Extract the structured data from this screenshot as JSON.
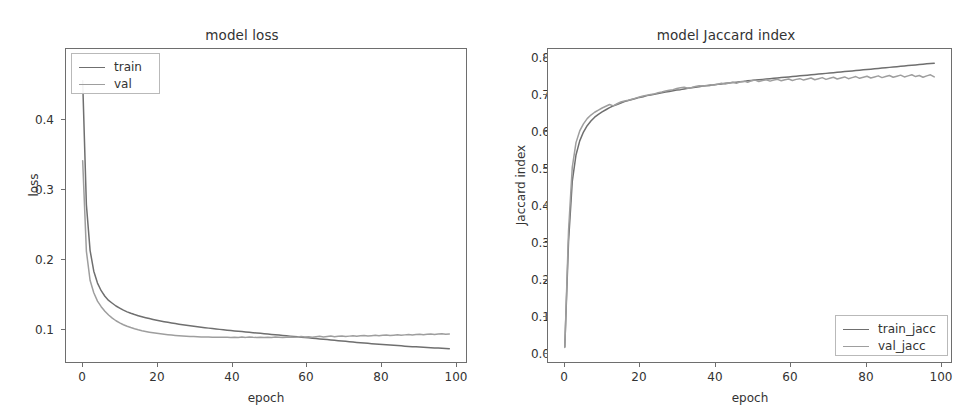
{
  "figure": {
    "background": "#ffffff",
    "width": 968,
    "height": 418
  },
  "colors": {
    "train": "#6f6f6f",
    "val": "#9e9e9e",
    "axis": "#6e6e6e",
    "text": "#333333"
  },
  "panels": {
    "loss": {
      "title": "model loss",
      "xlabel": "epoch",
      "ylabel": "loss",
      "xticks": [
        "0",
        "20",
        "40",
        "60",
        "80",
        "100"
      ],
      "yticks": [
        "0.1",
        "0.2",
        "0.3",
        "0.4"
      ],
      "legend": {
        "position": "upper left",
        "entries": [
          "train",
          "val"
        ]
      }
    },
    "jaccard": {
      "title": "model Jaccard index",
      "xlabel": "epoch",
      "ylabel": "Jaccard index",
      "xticks": [
        "0",
        "20",
        "40",
        "60",
        "80",
        "100"
      ],
      "yticks": [
        "0.0",
        "0.1",
        "0.2",
        "0.3",
        "0.4",
        "0.5",
        "0.6",
        "0.7",
        "0.8"
      ],
      "legend": {
        "position": "lower right",
        "entries": [
          "train_jacc",
          "val_jacc"
        ]
      }
    }
  },
  "chart_data": [
    {
      "type": "line",
      "title": "model loss",
      "xlabel": "epoch",
      "ylabel": "loss",
      "xlim": [
        -4.5,
        103.5
      ],
      "ylim": [
        0.0255,
        0.4755
      ],
      "xticks": [
        0,
        20,
        40,
        60,
        80,
        100
      ],
      "yticks": [
        0.1,
        0.2,
        0.3,
        0.4
      ],
      "grid": false,
      "legend_position": "upper left",
      "x": [
        0,
        1,
        2,
        3,
        4,
        5,
        6,
        7,
        8,
        9,
        10,
        11,
        12,
        13,
        14,
        15,
        16,
        17,
        18,
        19,
        20,
        21,
        22,
        23,
        24,
        25,
        26,
        27,
        28,
        29,
        30,
        31,
        32,
        33,
        34,
        35,
        36,
        37,
        38,
        39,
        40,
        41,
        42,
        43,
        44,
        45,
        46,
        47,
        48,
        49,
        50,
        51,
        52,
        53,
        54,
        55,
        56,
        57,
        58,
        59,
        60,
        61,
        62,
        63,
        64,
        65,
        66,
        67,
        68,
        69,
        70,
        71,
        72,
        73,
        74,
        75,
        76,
        77,
        78,
        79,
        80,
        81,
        82,
        83,
        84,
        85,
        86,
        87,
        88,
        89,
        90,
        91,
        92,
        93,
        94,
        95,
        96,
        97,
        98,
        99
      ],
      "series": [
        {
          "name": "train",
          "color": "#6f6f6f",
          "values": [
            0.43,
            0.252,
            0.186,
            0.156,
            0.139,
            0.128,
            0.12,
            0.114,
            0.11,
            0.106,
            0.103,
            0.1,
            0.0975,
            0.0955,
            0.0937,
            0.0921,
            0.0906,
            0.0892,
            0.0879,
            0.0867,
            0.0856,
            0.0845,
            0.0835,
            0.0825,
            0.0816,
            0.0807,
            0.0799,
            0.0791,
            0.0783,
            0.0776,
            0.0769,
            0.0762,
            0.0755,
            0.0748,
            0.0742,
            0.0736,
            0.073,
            0.0724,
            0.0718,
            0.0713,
            0.0707,
            0.0702,
            0.0697,
            0.0692,
            0.0687,
            0.0682,
            0.0677,
            0.0672,
            0.0667,
            0.0662,
            0.0657,
            0.0652,
            0.0647,
            0.0642,
            0.0637,
            0.0632,
            0.0627,
            0.0622,
            0.0617,
            0.0612,
            0.0607,
            0.0602,
            0.0597,
            0.0592,
            0.0587,
            0.0582,
            0.0577,
            0.0572,
            0.0567,
            0.0562,
            0.0557,
            0.0552,
            0.0547,
            0.0542,
            0.0537,
            0.0532,
            0.0527,
            0.0523,
            0.0519,
            0.0515,
            0.0511,
            0.0507,
            0.0503,
            0.0499,
            0.0495,
            0.0491,
            0.0487,
            0.0483,
            0.0479,
            0.0476,
            0.0473,
            0.047,
            0.0467,
            0.0464,
            0.0461,
            0.0458,
            0.0455,
            0.0452,
            0.0449,
            0.0446
          ]
        },
        {
          "name": "val",
          "color": "#9e9e9e",
          "values": [
            0.315,
            0.185,
            0.143,
            0.125,
            0.113,
            0.105,
            0.0985,
            0.093,
            0.0885,
            0.0848,
            0.0817,
            0.0791,
            0.0769,
            0.075,
            0.0733,
            0.0718,
            0.0705,
            0.0694,
            0.0684,
            0.0675,
            0.0667,
            0.066,
            0.0653,
            0.0647,
            0.0642,
            0.0637,
            0.0633,
            0.0629,
            0.0626,
            0.0623,
            0.062,
            0.0618,
            0.0616,
            0.0614,
            0.0613,
            0.0612,
            0.0611,
            0.061,
            0.061,
            0.061,
            0.0609,
            0.0612,
            0.0608,
            0.0613,
            0.0609,
            0.0615,
            0.061,
            0.0607,
            0.0611,
            0.0608,
            0.0612,
            0.0609,
            0.0613,
            0.061,
            0.0608,
            0.0612,
            0.0616,
            0.061,
            0.0614,
            0.062,
            0.0613,
            0.0617,
            0.061,
            0.0619,
            0.0624,
            0.0615,
            0.0621,
            0.0628,
            0.0618,
            0.0625,
            0.063,
            0.0622,
            0.0627,
            0.0633,
            0.0624,
            0.0631,
            0.0637,
            0.0628,
            0.0634,
            0.064,
            0.0631,
            0.0638,
            0.0644,
            0.0635,
            0.0641,
            0.0647,
            0.0638,
            0.0645,
            0.0651,
            0.0642,
            0.0649,
            0.0655,
            0.0646,
            0.0653,
            0.0659,
            0.065,
            0.0656,
            0.0662,
            0.0653,
            0.0659
          ]
        }
      ]
    },
    {
      "type": "line",
      "title": "model Jaccard index",
      "xlabel": "epoch",
      "ylabel": "Jaccard index",
      "xlim": [
        -4.5,
        103.5
      ],
      "ylim": [
        -0.041,
        0.845
      ],
      "xticks": [
        0,
        20,
        40,
        60,
        80,
        100
      ],
      "yticks": [
        0.0,
        0.1,
        0.2,
        0.3,
        0.4,
        0.5,
        0.6,
        0.7,
        0.8
      ],
      "grid": false,
      "legend_position": "lower right",
      "x": [
        0,
        1,
        2,
        3,
        4,
        5,
        6,
        7,
        8,
        9,
        10,
        11,
        12,
        13,
        14,
        15,
        16,
        17,
        18,
        19,
        20,
        21,
        22,
        23,
        24,
        25,
        26,
        27,
        28,
        29,
        30,
        31,
        32,
        33,
        34,
        35,
        36,
        37,
        38,
        39,
        40,
        41,
        42,
        43,
        44,
        45,
        46,
        47,
        48,
        49,
        50,
        51,
        52,
        53,
        54,
        55,
        56,
        57,
        58,
        59,
        60,
        61,
        62,
        63,
        64,
        65,
        66,
        67,
        68,
        69,
        70,
        71,
        72,
        73,
        74,
        75,
        76,
        77,
        78,
        79,
        80,
        81,
        82,
        83,
        84,
        85,
        86,
        87,
        88,
        89,
        90,
        91,
        92,
        93,
        94,
        95,
        96,
        97,
        98,
        99
      ],
      "series": [
        {
          "name": "train_jacc",
          "color": "#6f6f6f",
          "values": [
            0.002,
            0.3,
            0.47,
            0.545,
            0.585,
            0.61,
            0.628,
            0.641,
            0.652,
            0.66,
            0.667,
            0.673,
            0.679,
            0.684,
            0.688,
            0.692,
            0.696,
            0.699,
            0.702,
            0.705,
            0.708,
            0.71,
            0.713,
            0.715,
            0.717,
            0.719,
            0.721,
            0.723,
            0.725,
            0.727,
            0.729,
            0.73,
            0.732,
            0.734,
            0.735,
            0.737,
            0.738,
            0.74,
            0.741,
            0.742,
            0.744,
            0.745,
            0.746,
            0.748,
            0.749,
            0.75,
            0.751,
            0.752,
            0.753,
            0.755,
            0.756,
            0.757,
            0.758,
            0.759,
            0.76,
            0.761,
            0.762,
            0.763,
            0.764,
            0.765,
            0.766,
            0.767,
            0.768,
            0.769,
            0.77,
            0.771,
            0.772,
            0.773,
            0.774,
            0.775,
            0.776,
            0.777,
            0.778,
            0.779,
            0.78,
            0.781,
            0.782,
            0.783,
            0.784,
            0.785,
            0.786,
            0.787,
            0.788,
            0.789,
            0.79,
            0.791,
            0.792,
            0.793,
            0.794,
            0.795,
            0.796,
            0.797,
            0.798,
            0.799,
            0.8,
            0.801,
            0.802,
            0.803,
            0.804,
            0.805
          ]
        },
        {
          "name": "val_jacc",
          "color": "#9e9e9e",
          "values": [
            0.0,
            0.33,
            0.51,
            0.58,
            0.613,
            0.633,
            0.648,
            0.658,
            0.666,
            0.672,
            0.678,
            0.683,
            0.688,
            0.684,
            0.69,
            0.695,
            0.698,
            0.7,
            0.703,
            0.706,
            0.709,
            0.712,
            0.714,
            0.716,
            0.718,
            0.721,
            0.723,
            0.726,
            0.728,
            0.73,
            0.733,
            0.735,
            0.737,
            0.734,
            0.736,
            0.739,
            0.741,
            0.74,
            0.742,
            0.744,
            0.743,
            0.745,
            0.748,
            0.746,
            0.749,
            0.751,
            0.748,
            0.752,
            0.754,
            0.751,
            0.755,
            0.757,
            0.753,
            0.756,
            0.758,
            0.754,
            0.757,
            0.759,
            0.755,
            0.758,
            0.76,
            0.756,
            0.759,
            0.761,
            0.757,
            0.76,
            0.763,
            0.758,
            0.761,
            0.764,
            0.759,
            0.762,
            0.765,
            0.76,
            0.763,
            0.766,
            0.761,
            0.764,
            0.767,
            0.762,
            0.765,
            0.768,
            0.763,
            0.766,
            0.769,
            0.764,
            0.767,
            0.77,
            0.765,
            0.768,
            0.771,
            0.766,
            0.769,
            0.772,
            0.767,
            0.77,
            0.765,
            0.769,
            0.772,
            0.766
          ]
        }
      ]
    }
  ]
}
